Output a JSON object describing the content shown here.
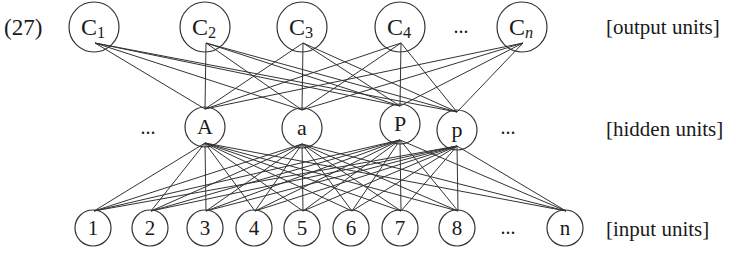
{
  "example_number": "(27)",
  "layers": {
    "output": {
      "label": "[output units]",
      "y": 27,
      "r": 25,
      "nodes": [
        {
          "id": "C1",
          "text": "C",
          "sub": "1",
          "x": 94
        },
        {
          "id": "C2",
          "text": "C",
          "sub": "2",
          "x": 205
        },
        {
          "id": "C3",
          "text": "C",
          "sub": "3",
          "x": 302
        },
        {
          "id": "C4",
          "text": "C",
          "sub": "4",
          "x": 400
        },
        {
          "id": "Cn",
          "text": "C",
          "sub": "n",
          "sub_italic": true,
          "x": 522
        }
      ],
      "ellipsis": {
        "text": "...",
        "x": 461
      }
    },
    "hidden": {
      "label": "[hidden units]",
      "r": 20,
      "nodes": [
        {
          "id": "A",
          "text": "A",
          "x": 205,
          "y": 127
        },
        {
          "id": "a",
          "text": "a",
          "x": 302,
          "y": 128
        },
        {
          "id": "P",
          "text": "P",
          "x": 400,
          "y": 124
        },
        {
          "id": "p",
          "text": "p",
          "x": 457,
          "y": 130
        }
      ],
      "ellipsis_left": {
        "text": "...",
        "x": 148
      },
      "ellipsis_right": {
        "text": "...",
        "x": 508
      }
    },
    "input": {
      "label": "[input units]",
      "y": 228,
      "r": 18,
      "nodes": [
        {
          "id": "1",
          "text": "1",
          "x": 93
        },
        {
          "id": "2",
          "text": "2",
          "x": 150
        },
        {
          "id": "3",
          "text": "3",
          "x": 205
        },
        {
          "id": "4",
          "text": "4",
          "x": 254
        },
        {
          "id": "5",
          "text": "5",
          "x": 302
        },
        {
          "id": "6",
          "text": "6",
          "x": 351
        },
        {
          "id": "7",
          "text": "7",
          "x": 400
        },
        {
          "id": "8",
          "text": "8",
          "x": 457
        },
        {
          "id": "n",
          "text": "n",
          "x": 565
        }
      ],
      "ellipsis": {
        "text": "...",
        "x": 508
      }
    }
  },
  "connections": {
    "output_to_hidden": "fully-connected",
    "hidden_to_input": "fully-connected"
  },
  "colors": {
    "stroke": "#333333",
    "text": "#1a1a1a",
    "background": "#ffffff"
  }
}
